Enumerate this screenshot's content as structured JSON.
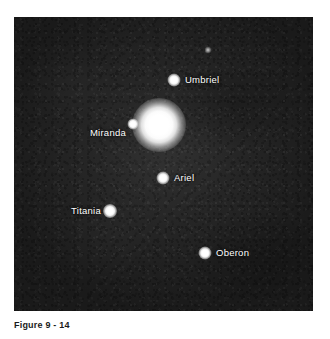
{
  "figure": {
    "alt_name": "uranus-and-moons-photograph",
    "background_color": "#242424",
    "frame": {
      "x": 14,
      "y": 17,
      "width": 299,
      "height": 294
    },
    "objects": [
      {
        "name": "Uranus",
        "kind": "planet",
        "x": 159,
        "y": 125,
        "size": 54,
        "labeled": false,
        "label": ""
      },
      {
        "name": "Umbriel",
        "kind": "moon",
        "x": 174,
        "y": 80,
        "size": 13,
        "labeled": true,
        "label": "Umbriel",
        "label_side": "right",
        "label_x": 185,
        "label_y": 80
      },
      {
        "name": "Miranda",
        "kind": "moon",
        "x": 133,
        "y": 124,
        "size": 11,
        "labeled": true,
        "label": "Miranda",
        "label_side": "left",
        "label_x": 126,
        "label_y": 133
      },
      {
        "name": "Ariel",
        "kind": "moon",
        "x": 163,
        "y": 178,
        "size": 13,
        "labeled": true,
        "label": "Ariel",
        "label_side": "right",
        "label_x": 174,
        "label_y": 178
      },
      {
        "name": "Titania",
        "kind": "moon",
        "x": 110,
        "y": 211,
        "size": 14,
        "labeled": true,
        "label": "Titania",
        "label_side": "left",
        "label_x": 101,
        "label_y": 211
      },
      {
        "name": "Oberon",
        "kind": "moon",
        "x": 205,
        "y": 253,
        "size": 13,
        "labeled": true,
        "label": "Oberon",
        "label_side": "right",
        "label_x": 216,
        "label_y": 253
      },
      {
        "name": "background star",
        "kind": "faint-star",
        "x": 208,
        "y": 50,
        "size": 7,
        "labeled": false,
        "label": ""
      }
    ]
  },
  "caption": {
    "text": "Figure 9 - 14"
  }
}
